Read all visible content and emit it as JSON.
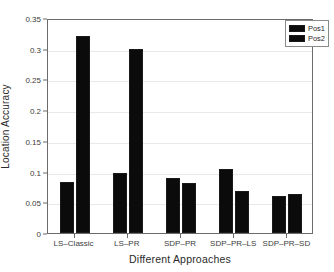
{
  "chart_data": {
    "type": "bar",
    "title": "",
    "xlabel": "Different Approaches",
    "ylabel": "Location Accuracy",
    "categories": [
      "LS-Classic",
      "LS-PR",
      "SDP-PR",
      "SDP-PR-LS",
      "SDP-PR-SD"
    ],
    "series": [
      {
        "name": "Pos1",
        "values": [
          0.083,
          0.098,
          0.09,
          0.104,
          0.06
        ],
        "color": "#0b0b0b"
      },
      {
        "name": "Pos2",
        "values": [
          0.32,
          0.3,
          0.082,
          0.068,
          0.064
        ],
        "color": "#0b0b0b"
      }
    ],
    "ylim": [
      0,
      0.35
    ],
    "ytick_labels": [
      "0",
      "0.05",
      "0.1",
      "0.15",
      "0.2",
      "0.25",
      "0.3",
      "0.35"
    ],
    "ytick_values": [
      0,
      0.05,
      0.1,
      0.15,
      0.2,
      0.25,
      0.3,
      0.35
    ],
    "grid": true,
    "grid_axis": "y",
    "legend_position": "top-right",
    "legend_entries": [
      "Pos1",
      "Pos2"
    ],
    "bar_edge_color": "#1a1a1a",
    "axis_color": "#6b6b6b"
  }
}
